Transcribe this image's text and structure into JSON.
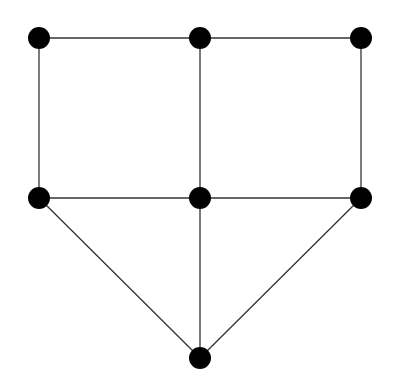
{
  "diagram": {
    "type": "undirected-graph",
    "width": 394,
    "height": 391,
    "node_radius": 11,
    "node_color": "#000000",
    "edge_color": "#333333",
    "background": "#ffffff",
    "nodes": [
      {
        "id": "n1",
        "x": 39,
        "y": 38
      },
      {
        "id": "n2",
        "x": 200,
        "y": 38
      },
      {
        "id": "n3",
        "x": 361,
        "y": 38
      },
      {
        "id": "n4",
        "x": 39,
        "y": 198
      },
      {
        "id": "n5",
        "x": 200,
        "y": 198
      },
      {
        "id": "n6",
        "x": 361,
        "y": 198
      },
      {
        "id": "n7",
        "x": 200,
        "y": 358
      }
    ],
    "edges": [
      [
        "n1",
        "n2"
      ],
      [
        "n2",
        "n3"
      ],
      [
        "n1",
        "n4"
      ],
      [
        "n2",
        "n5"
      ],
      [
        "n3",
        "n6"
      ],
      [
        "n4",
        "n5"
      ],
      [
        "n5",
        "n6"
      ],
      [
        "n4",
        "n7"
      ],
      [
        "n5",
        "n7"
      ],
      [
        "n6",
        "n7"
      ]
    ]
  }
}
